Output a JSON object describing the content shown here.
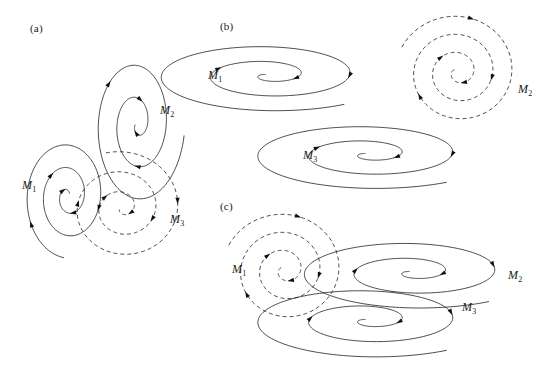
{
  "figure": {
    "background_color": "#ffffff",
    "stroke_color": "#101010",
    "width": 549,
    "height": 368
  },
  "panels": [
    {
      "id": "a",
      "label": "(a)",
      "label_x": 30,
      "label_y": 22,
      "masses": [
        {
          "name": "M1",
          "label": "M",
          "subscript": "1",
          "style": "solid",
          "x": 22,
          "y": 178
        },
        {
          "name": "M2",
          "label": "M",
          "subscript": "2",
          "style": "solid",
          "x": 160,
          "y": 103
        },
        {
          "name": "M3",
          "label": "M",
          "subscript": "3",
          "style": "dashed",
          "x": 170,
          "y": 212
        }
      ]
    },
    {
      "id": "b",
      "label": "(b)",
      "label_x": 220,
      "label_y": 20,
      "masses": [
        {
          "name": "M1",
          "label": "M",
          "subscript": "1",
          "style": "solid",
          "x": 208,
          "y": 68
        },
        {
          "name": "M2",
          "label": "M",
          "subscript": "2",
          "style": "dashed",
          "x": 518,
          "y": 82
        },
        {
          "name": "M3",
          "label": "M",
          "subscript": "3",
          "style": "solid",
          "x": 303,
          "y": 148
        }
      ]
    },
    {
      "id": "c",
      "label": "(c)",
      "label_x": 220,
      "label_y": 200,
      "masses": [
        {
          "name": "M1",
          "label": "M",
          "subscript": "1",
          "style": "dashed",
          "x": 232,
          "y": 262
        },
        {
          "name": "M2",
          "label": "M",
          "subscript": "2",
          "style": "solid",
          "x": 508,
          "y": 268
        },
        {
          "name": "M3",
          "label": "M",
          "subscript": "3",
          "style": "solid",
          "x": 462,
          "y": 300
        }
      ]
    }
  ],
  "chart_data": {
    "type": "scatter",
    "xlabel": "",
    "ylabel": "",
    "series": [
      {
        "name": "panel-a-M1",
        "panel": "a",
        "mass": "M1",
        "style": "solid",
        "center": [
          68,
          196
        ],
        "turns": 2.6,
        "start_radius": 62,
        "end_radius": 3,
        "start_angle_deg": 95,
        "radius_x_scale": 0.72,
        "radius_y_scale": 1.0,
        "arrow_fractions": [
          0.06,
          0.3,
          0.52,
          0.74,
          0.9
        ]
      },
      {
        "name": "panel-a-M2",
        "panel": "a",
        "mass": "M2",
        "style": "solid",
        "center": [
          137,
          124
        ],
        "turns": 2.45,
        "start_radius": 82,
        "end_radius": 3,
        "start_angle_deg": 8,
        "radius_x_scale": 0.58,
        "radius_y_scale": 1.0,
        "arrow_fractions": [
          0.24,
          0.5,
          0.72,
          0.92
        ]
      },
      {
        "name": "panel-a-M3",
        "panel": "a",
        "mass": "M3",
        "style": "dashed",
        "center": [
          122,
          208
        ],
        "turns": 2.7,
        "start_radius": 62,
        "end_radius": 3,
        "start_angle_deg": 255,
        "radius_x_scale": 1.0,
        "radius_y_scale": 0.92,
        "arrow_fractions": [
          0.1,
          0.3,
          0.5,
          0.7,
          0.88
        ]
      },
      {
        "name": "panel-b-M1",
        "panel": "b",
        "mass": "M1",
        "style": "solid",
        "center": [
          268,
          75
        ],
        "turns": 2.45,
        "start_radius": 124,
        "end_radius": 3,
        "start_angle_deg": 52,
        "radius_x_scale": 1.0,
        "radius_y_scale": 0.3,
        "arrow_fractions": [
          0.35,
          0.58,
          0.78
        ]
      },
      {
        "name": "panel-b-M2",
        "panel": "b",
        "mass": "M2",
        "style": "dashed",
        "center": [
          458,
          72
        ],
        "turns": 3.1,
        "start_radius": 62,
        "end_radius": 3,
        "start_angle_deg": 205,
        "radius_x_scale": 1.0,
        "radius_y_scale": 0.95,
        "arrow_fractions": [
          0.07,
          0.27,
          0.47,
          0.66,
          0.84
        ]
      },
      {
        "name": "panel-b-M3",
        "panel": "b",
        "mass": "M3",
        "style": "solid",
        "center": [
          368,
          154
        ],
        "turns": 2.45,
        "start_radius": 128,
        "end_radius": 3,
        "start_angle_deg": 52,
        "radius_x_scale": 1.0,
        "radius_y_scale": 0.28,
        "arrow_fractions": [
          0.35,
          0.58,
          0.78
        ]
      },
      {
        "name": "panel-c-M1",
        "panel": "c",
        "mass": "M1",
        "style": "dashed",
        "center": [
          285,
          270
        ],
        "turns": 3.1,
        "start_radius": 62,
        "end_radius": 3,
        "start_angle_deg": 205,
        "radius_x_scale": 1.0,
        "radius_y_scale": 0.95,
        "arrow_fractions": [
          0.07,
          0.27,
          0.47,
          0.66,
          0.84
        ]
      },
      {
        "name": "panel-c-M2",
        "panel": "c",
        "mass": "M2",
        "style": "solid",
        "center": [
          412,
          272
        ],
        "turns": 2.45,
        "start_radius": 125,
        "end_radius": 3,
        "start_angle_deg": 52,
        "radius_x_scale": 1.0,
        "radius_y_scale": 0.3,
        "arrow_fractions": [
          0.33,
          0.56,
          0.77
        ]
      },
      {
        "name": "panel-c-M3",
        "panel": "c",
        "mass": "M3",
        "style": "solid",
        "center": [
          368,
          320
        ],
        "turns": 2.45,
        "start_radius": 128,
        "end_radius": 3,
        "start_angle_deg": 52,
        "radius_x_scale": 1.0,
        "radius_y_scale": 0.3,
        "arrow_fractions": [
          0.33,
          0.56,
          0.77
        ]
      }
    ]
  }
}
